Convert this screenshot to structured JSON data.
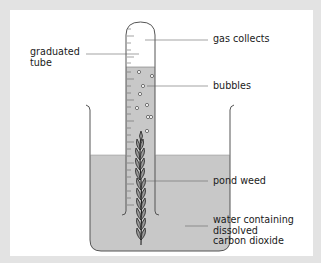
{
  "diagram": {
    "colors": {
      "background": "#e3e3e3",
      "panel": "#ffffff",
      "water": "#c8c8c8",
      "outline": "#555555",
      "leader": "#666666",
      "text": "#1a1a1a"
    },
    "labels": {
      "graduated_tube": "graduated\ntube",
      "gas_collects": "gas collects",
      "bubbles": "bubbles",
      "pond_weed": "pond weed",
      "water": "water containing\ndissolved\ncarbon dioxide"
    }
  }
}
